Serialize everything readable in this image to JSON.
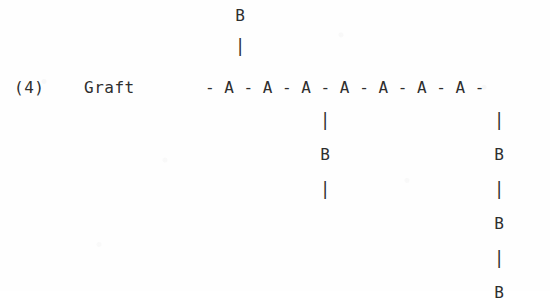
{
  "figure": {
    "caption_number": "(4)",
    "caption_label": "Graft",
    "background_color": "#fefefe",
    "ink_color": "#2e2e2e"
  },
  "backbone": {
    "text": "- A - A - A - A - A - A - A -",
    "unit_symbol": "A",
    "unit_count": 7,
    "bond_symbol": "-",
    "leading_bond": "-",
    "trailing_bond": "-"
  },
  "branches": [
    {
      "id": "branch-up-a1",
      "attached_to_unit": 1,
      "direction": "up",
      "node_symbol": "B",
      "bond_symbol": "|",
      "sequence": [
        "B",
        "|"
      ],
      "node_count": 1,
      "terminal_bond": false
    },
    {
      "id": "branch-down-a3",
      "attached_to_unit": 3,
      "direction": "down",
      "node_symbol": "B",
      "bond_symbol": "|",
      "sequence": [
        "|",
        "B",
        "|"
      ],
      "node_count": 1,
      "terminal_bond": true
    },
    {
      "id": "branch-down-a7",
      "attached_to_unit": 7,
      "direction": "down",
      "node_symbol": "B",
      "bond_symbol": "|",
      "sequence": [
        "|",
        "B",
        "|",
        "B",
        "|",
        "B"
      ],
      "node_count": 3,
      "terminal_bond": false
    }
  ]
}
